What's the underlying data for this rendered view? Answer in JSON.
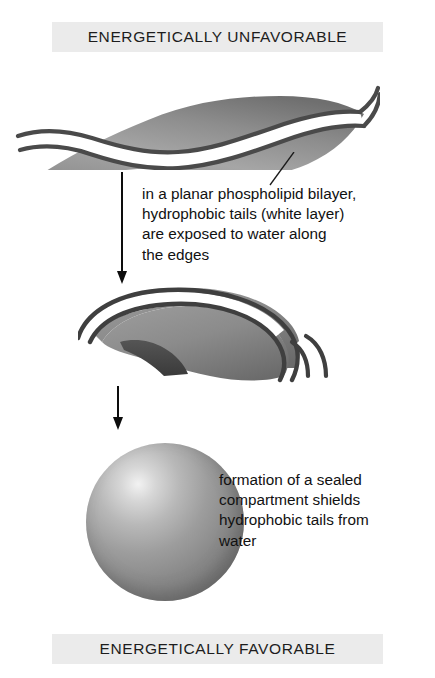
{
  "banners": {
    "top": "ENERGETICALLY UNFAVORABLE",
    "bottom": "ENERGETICALLY FAVORABLE"
  },
  "captions": {
    "planar": "in a planar phospholipid bilayer,\nhydrophobic tails (white layer)\nare exposed to water along\nthe edges",
    "sphere": "formation of a sealed\ncompartment shields\nhydrophobic tails from\nwater"
  },
  "figure": {
    "stages": [
      "planar-phospholipid-bilayer-sheet",
      "curved-cup-shaped-bilayer",
      "sealed-spherical-vesicle"
    ],
    "arrows": [
      "downward-arrow-1",
      "downward-arrow-2"
    ],
    "leader_line": "pointer-from-sheet-edge-to-caption"
  },
  "colors": {
    "banner_background": "#ebebeb",
    "banner_text": "#1d1d1d",
    "caption_text": "#111111",
    "membrane_surface_light": "#b4b4b4",
    "membrane_surface_dark": "#6b6b6b",
    "membrane_edge_line": "#4a4a4a",
    "hydrophobic_tail_layer": "#ffffff",
    "arrow": "#0d0d0d",
    "sphere_highlight": "#f2f2f2",
    "sphere_shade": "#6f6f6f"
  }
}
